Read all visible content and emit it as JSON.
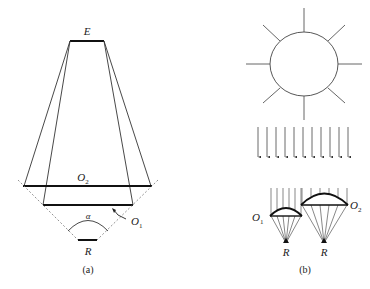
{
  "figure": {
    "panel_a": {
      "caption": "(a)",
      "labels": {
        "eye": "E",
        "objective_2": "O",
        "objective_2_sub": "2",
        "objective_1": "O",
        "objective_1_sub": "1",
        "angle": "α",
        "receiver": "R"
      }
    },
    "panel_b": {
      "caption": "(b)",
      "labels": {
        "objective_1": "O",
        "objective_1_sub": "1",
        "objective_2": "O",
        "objective_2_sub": "2",
        "receiver_1": "R",
        "receiver_2": "R"
      },
      "sun_rays": 8,
      "parallel_arrows": 11
    }
  },
  "colors": {
    "line": "#333333",
    "thick": "#111111",
    "dashed": "#777777",
    "background": "#ffffff"
  }
}
